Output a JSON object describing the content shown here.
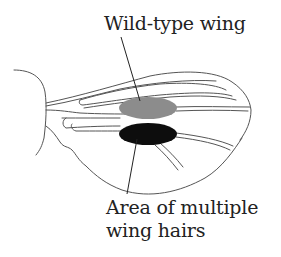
{
  "diagram": {
    "labels": {
      "wild_type": "Wild-type wing",
      "mutant_line1": "Area of multiple",
      "mutant_line2": "wing hairs"
    },
    "regions": [
      {
        "name": "wild-type-region",
        "fill": "#8c8c8c"
      },
      {
        "name": "multiple-hairs-region",
        "fill": "#0d0d0d"
      }
    ],
    "colors": {
      "outline": "#555555",
      "text": "#222222",
      "background": "#ffffff"
    }
  }
}
